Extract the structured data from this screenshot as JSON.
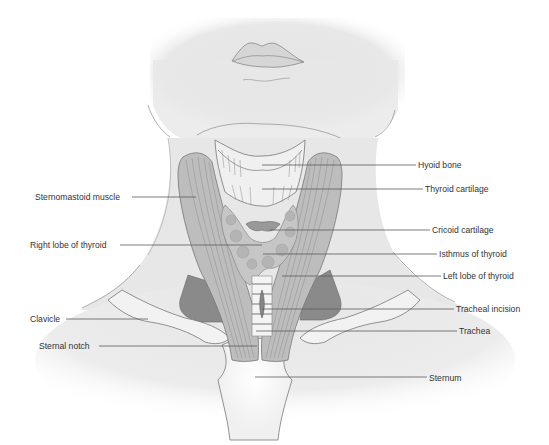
{
  "figure": {
    "colors": {
      "skin": "#e6e6e6",
      "outline": "#7a7a7a",
      "muscle": "#b9b9b9",
      "muscle_dark": "#7e7e7e",
      "thyroid": "#c4c4c4",
      "bone": "#f2f2f2",
      "text": "#333333",
      "leader": "#5a5a5a"
    }
  },
  "labels": {
    "left": [
      {
        "text": "Sternomastoid muscle",
        "x": 35,
        "y": 192,
        "line_x1": 132,
        "line_x2": 196,
        "line_y": 197
      },
      {
        "text": "Right lobe of thyroid",
        "x": 30,
        "y": 240,
        "line_x1": 120,
        "line_x2": 262,
        "line_y": 245
      },
      {
        "text": "Clavicle",
        "x": 30,
        "y": 314,
        "line_x1": 66,
        "line_x2": 148,
        "line_y": 319
      },
      {
        "text": "Sternal notch",
        "x": 39,
        "y": 341,
        "line_x1": 99,
        "line_x2": 257,
        "line_y": 346
      }
    ],
    "right": [
      {
        "text": "Hyoid bone",
        "x": 418,
        "y": 160,
        "line_x1": 262,
        "line_x2": 416,
        "line_y": 165
      },
      {
        "text": "Thyroid cartilage",
        "x": 425,
        "y": 184,
        "line_x1": 262,
        "line_x2": 423,
        "line_y": 189
      },
      {
        "text": "Cricoid cartilage",
        "x": 432,
        "y": 225,
        "line_x1": 270,
        "line_x2": 430,
        "line_y": 230
      },
      {
        "text": "Isthmus of thyroid",
        "x": 439,
        "y": 249,
        "line_x1": 263,
        "line_x2": 437,
        "line_y": 254
      },
      {
        "text": "Left lobe of thyroid",
        "x": 443,
        "y": 271,
        "line_x1": 282,
        "line_x2": 441,
        "line_y": 276
      },
      {
        "text": "Tracheal incision",
        "x": 456,
        "y": 304,
        "line_x1": 262,
        "line_x2": 454,
        "line_y": 309
      },
      {
        "text": "Trachea",
        "x": 459,
        "y": 326,
        "line_x1": 256,
        "line_x2": 457,
        "line_y": 331
      },
      {
        "text": "Sternum",
        "x": 429,
        "y": 373,
        "line_x1": 255,
        "line_x2": 427,
        "line_y": 377
      }
    ]
  }
}
